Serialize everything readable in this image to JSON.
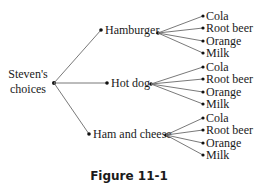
{
  "diagram": {
    "type": "tree-diagram",
    "root": {
      "label_lines": [
        "Steven's",
        "choices"
      ]
    },
    "branches": [
      {
        "label": "Hamburger",
        "children": [
          "Cola",
          "Root beer",
          "Orange",
          "Milk"
        ]
      },
      {
        "label": "Hot dog",
        "children": [
          "Cola",
          "Root beer",
          "Orange",
          "Milk"
        ]
      },
      {
        "label": "Ham and cheese",
        "children": [
          "Cola",
          "Root beer",
          "Orange",
          "Milk"
        ]
      }
    ],
    "caption": "Figure 11-1"
  }
}
